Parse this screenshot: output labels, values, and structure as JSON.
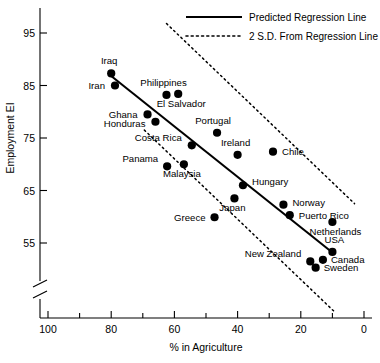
{
  "chart_data": {
    "type": "scatter",
    "title": "",
    "xlabel": "% in Agriculture",
    "ylabel": "Employment EI",
    "xlim": [
      100,
      0
    ],
    "ylim": [
      50,
      98
    ],
    "x_axis_reversed": true,
    "y_axis_break": true,
    "grid": false,
    "xticks": [
      100,
      80,
      60,
      40,
      20,
      0
    ],
    "xminorticks": [
      90,
      70,
      50,
      30,
      10
    ],
    "yticks": [
      95,
      85,
      75,
      65,
      55
    ],
    "legend_position": "top-right",
    "legend": [
      {
        "label": "Predicted Regression Line",
        "style": "solid"
      },
      {
        "label": "2 S.D. From Regression Line",
        "style": "dotted"
      }
    ],
    "points": [
      {
        "label": "Iraq",
        "x": 80.0,
        "y": 87.3,
        "label_dx": -2,
        "label_dy": -9,
        "anchor": "middle"
      },
      {
        "label": "Iran",
        "x": 78.8,
        "y": 85.0,
        "label_dx": -10,
        "label_dy": 3.5,
        "anchor": "end"
      },
      {
        "label": "Philippines",
        "x": 62.5,
        "y": 83.2,
        "label_dx": -3,
        "label_dy": -9,
        "anchor": "middle"
      },
      {
        "label": "El Salvador",
        "x": 58.8,
        "y": 83.4,
        "label_dx": 3,
        "label_dy": 13,
        "anchor": "middle"
      },
      {
        "label": "Ghana",
        "x": 68.5,
        "y": 79.5,
        "label_dx": -10,
        "label_dy": 3.5,
        "anchor": "end"
      },
      {
        "label": "Honduras",
        "x": 66.0,
        "y": 78.1,
        "label_dx": -10,
        "label_dy": 5.5,
        "anchor": "end"
      },
      {
        "label": "Portugal",
        "x": 46.5,
        "y": 76.0,
        "label_dx": -4,
        "label_dy": -9,
        "anchor": "middle"
      },
      {
        "label": "Costa Rica",
        "x": 54.5,
        "y": 73.6,
        "label_dx": -10,
        "label_dy": -4,
        "anchor": "end"
      },
      {
        "label": "Ireland",
        "x": 40.0,
        "y": 71.8,
        "label_dx": -2,
        "label_dy": -9,
        "anchor": "middle"
      },
      {
        "label": "Chile",
        "x": 28.8,
        "y": 72.4,
        "label_dx": 9,
        "label_dy": 3.5,
        "anchor": "start"
      },
      {
        "label": "Panama",
        "x": 62.3,
        "y": 69.6,
        "label_dx": -9,
        "label_dy": -4,
        "anchor": "end"
      },
      {
        "label": "Malaysia",
        "x": 57.0,
        "y": 70.0,
        "label_dx": -2,
        "label_dy": 13,
        "anchor": "middle"
      },
      {
        "label": "Hungary",
        "x": 38.3,
        "y": 66.0,
        "label_dx": 9,
        "label_dy": 0,
        "anchor": "start"
      },
      {
        "label": "Japan",
        "x": 41.0,
        "y": 63.5,
        "label_dx": -2,
        "label_dy": 13,
        "anchor": "middle"
      },
      {
        "label": "Norway",
        "x": 25.5,
        "y": 62.3,
        "label_dx": 9,
        "label_dy": 1.5,
        "anchor": "start"
      },
      {
        "label": "Puerto Rico",
        "x": 23.5,
        "y": 60.3,
        "label_dx": 9,
        "label_dy": 3.5,
        "anchor": "start"
      },
      {
        "label": "Greece",
        "x": 47.3,
        "y": 59.9,
        "label_dx": -9,
        "label_dy": 3.5,
        "anchor": "end"
      },
      {
        "label": "Netherlands",
        "x": 10.0,
        "y": 59.0,
        "label_dx": 3,
        "label_dy": 13,
        "anchor": "middle"
      },
      {
        "label": "USA",
        "x": 10.0,
        "y": 53.3,
        "label_dx": 2,
        "label_dy": -9,
        "anchor": "middle"
      },
      {
        "label": "Canada",
        "x": 13.0,
        "y": 51.8,
        "label_dx": 8,
        "label_dy": 3.5,
        "anchor": "start"
      },
      {
        "label": "New Zealand",
        "x": 17.0,
        "y": 51.5,
        "label_dx": -9,
        "label_dy": -4,
        "anchor": "end"
      },
      {
        "label": "Sweden",
        "x": 15.3,
        "y": 50.3,
        "label_dx": 8,
        "label_dy": 3.5,
        "anchor": "start"
      }
    ],
    "regression_line": {
      "x1": 80.0,
      "y1": 86.8,
      "x2": 10.0,
      "y2": 53.2
    },
    "sd_bands": [
      {
        "name": "upper",
        "x1": 62.5,
        "y1": 96.8,
        "x2": 3.0,
        "y2": 62.5
      },
      {
        "name": "lower",
        "x1": 69.5,
        "y1": 76.5,
        "x2": 9.5,
        "y2": 42.0
      }
    ]
  }
}
